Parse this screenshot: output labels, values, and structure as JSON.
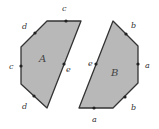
{
  "diagram": {
    "shapes": [
      {
        "name": "A",
        "vertices": [
          [
            47,
            21
          ],
          [
            81,
            21
          ],
          [
            47,
            108
          ],
          [
            21,
            84
          ],
          [
            21,
            47
          ]
        ],
        "edge_labels": [
          {
            "text": "c",
            "x": 64,
            "y": 11
          },
          {
            "text": "e",
            "x": 68,
            "y": 70
          },
          {
            "text": "d",
            "x": 25,
            "y": 103
          },
          {
            "text": "c",
            "x": 11,
            "y": 69
          },
          {
            "text": "d",
            "x": 25,
            "y": 28
          }
        ]
      },
      {
        "name": "B",
        "vertices": [
          [
            113,
            21
          ],
          [
            138,
            46
          ],
          [
            138,
            83
          ],
          [
            113,
            108
          ],
          [
            79,
            108
          ]
        ],
        "edge_labels": [
          {
            "text": "b",
            "x": 133,
            "y": 28
          },
          {
            "text": "a",
            "x": 147,
            "y": 68
          },
          {
            "text": "b",
            "x": 133,
            "y": 108
          },
          {
            "text": "a",
            "x": 94,
            "y": 122
          },
          {
            "text": "e",
            "x": 90,
            "y": 64
          }
        ]
      }
    ],
    "fill_color": "#b8b8b8",
    "stroke_color": "#333333"
  }
}
